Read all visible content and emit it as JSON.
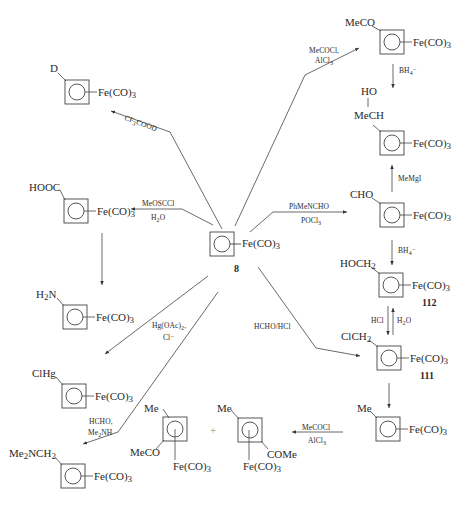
{
  "center": {
    "fe": "Fe(CO)",
    "sub": "3",
    "number": "8"
  },
  "compounds": {
    "deutero": {
      "sub": "D",
      "fe": "Fe(CO)",
      "fe_sub": "3"
    },
    "carboxy": {
      "sub": "HOOC",
      "fe": "Fe(CO)",
      "fe_sub": "3"
    },
    "amino": {
      "sub_a": "H",
      "sub_b": "2",
      "sub_c": "N",
      "fe": "Fe(CO)",
      "fe_sub": "3"
    },
    "chloromercurio": {
      "sub": "ClHg",
      "fe": "Fe(CO)",
      "fe_sub": "3"
    },
    "dimethylaminomethyl": {
      "sub_a": "Me",
      "sub_b": "2",
      "sub_c": "NCH",
      "sub_d": "2",
      "fe": "Fe(CO)",
      "fe_sub": "3"
    },
    "acetyl": {
      "sub": "MeCO",
      "fe": "Fe(CO)",
      "fe_sub": "3"
    },
    "hydroxyethyl": {
      "sub_top": "HO",
      "sub": "MeCH",
      "fe": "Fe(CO)",
      "fe_sub": "3"
    },
    "formyl": {
      "sub": "CHO",
      "fe": "Fe(CO)",
      "fe_sub": "3"
    },
    "hydroxymethyl": {
      "sub": "HOCH",
      "sub_2": "2",
      "fe": "Fe(CO)",
      "fe_sub": "3",
      "number": "112"
    },
    "chloromethyl": {
      "sub": "ClCH",
      "sub_2": "2",
      "fe": "Fe(CO)",
      "fe_sub": "3",
      "number": "111"
    },
    "methyl": {
      "sub": "Me",
      "fe": "Fe(CO)",
      "fe_sub": "3"
    },
    "product_a": {
      "sub_me": "Me",
      "sub_coc": "MeCO",
      "fe": "Fe(CO)",
      "fe_sub": "3"
    },
    "product_b": {
      "sub_me": "Me",
      "sub_coc": "COMe",
      "fe": "Fe(CO)",
      "fe_sub": "3"
    },
    "plus": "+"
  },
  "reagents": {
    "cf3cood": {
      "a": "CF",
      "b": "3",
      "c": "COOD"
    },
    "meoscl": {
      "line1": "MeOSCCl",
      "line2_a": "H",
      "line2_b": "2",
      "line2_c": "O"
    },
    "hgoac": {
      "line1_a": "Hg(OAc)",
      "line1_b": "2",
      "line1_c": ",",
      "line2": "Cl⁻"
    },
    "mannich": {
      "line1": "HCHO,",
      "line2_a": "Me",
      "line2_b": "2",
      "line2_c": "NH"
    },
    "acylation": {
      "line1": "MeCOCl,",
      "line2_a": "AlCl",
      "line2_b": "3"
    },
    "borohydride1": {
      "a": "BH",
      "b": "4",
      "c": "⁻"
    },
    "grignard": "MeMgI",
    "vilsmeier": {
      "line1": "PhMeNCHO",
      "line2_a": "POCl",
      "line2_b": "3"
    },
    "borohydride2": {
      "a": "BH",
      "b": "4",
      "c": "⁻"
    },
    "hcl": "HCl",
    "water": {
      "a": "H",
      "b": "2",
      "c": "O"
    },
    "chloromethylation": "HCHO/HCl",
    "acylation2": {
      "line1": "MeCOCl",
      "line2_a": "AlCl",
      "line2_b": "3"
    }
  }
}
